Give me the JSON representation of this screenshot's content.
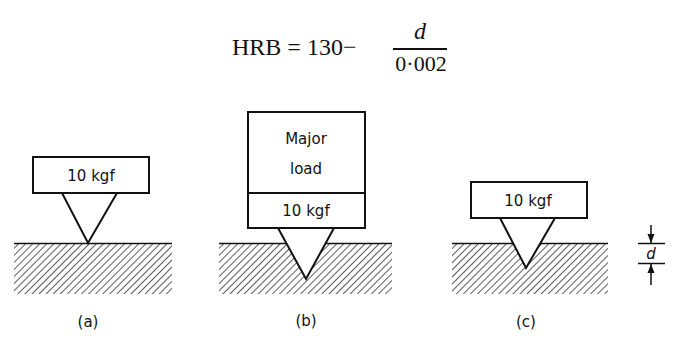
{
  "formula": {
    "lhs": "HRB = 130−",
    "numerator": "d",
    "denominator": "0·002",
    "full_text": "HRB = 130 − d / 0·002"
  },
  "panels": [
    {
      "id": "a",
      "caption": "(a)",
      "load_labels": [
        "10 kgf"
      ],
      "description": "Minor load applied; indenter tip at surface"
    },
    {
      "id": "b",
      "caption": "(b)",
      "load_labels": [
        "Major",
        "load",
        "10 kgf"
      ],
      "description": "Major load plus minor load applied; indenter penetrates deeply"
    },
    {
      "id": "c",
      "caption": "(c)",
      "load_labels": [
        "10 kgf"
      ],
      "description": "Major load removed; residual depth d measured"
    }
  ],
  "dimension": {
    "label": "d",
    "meaning": "depth of indentation"
  },
  "colors": {
    "ink": "#111111",
    "background": "#ffffff"
  }
}
